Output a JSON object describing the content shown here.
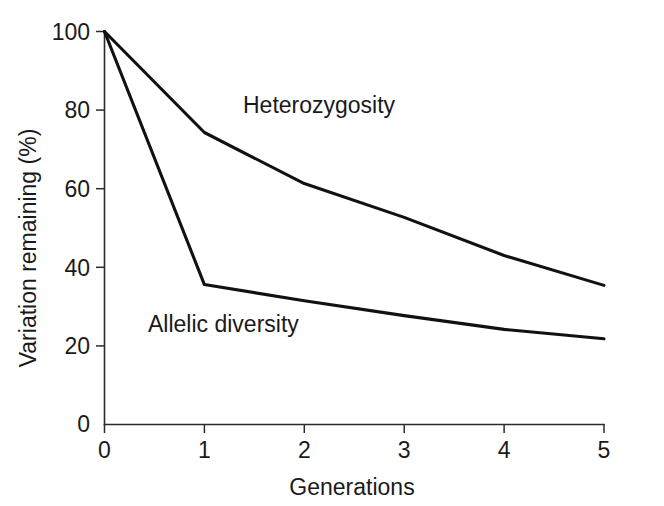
{
  "chart_data": {
    "type": "line",
    "title": "",
    "subtitle": "",
    "xlabel": "Generations",
    "ylabel": "Variation remaining (%)",
    "x": [
      0,
      1,
      2,
      3,
      4,
      5
    ],
    "xlim": [
      0,
      5
    ],
    "ylim": [
      0,
      100
    ],
    "xticks": [
      "0",
      "1",
      "2",
      "3",
      "4",
      "5"
    ],
    "yticks": [
      "0",
      "20",
      "40",
      "60",
      "80",
      "100"
    ],
    "grid": false,
    "legend_position": "inline-annotations",
    "series": [
      {
        "name": "Heterozygosity",
        "label": "Heterozygosity",
        "color": "#111111",
        "values": [
          100,
          74.3,
          61.3,
          52.7,
          43.0,
          35.4
        ]
      },
      {
        "name": "Allelic diversity",
        "label": "Allelic diversity",
        "color": "#111111",
        "values": [
          100,
          35.6,
          31.5,
          27.7,
          24.2,
          21.8
        ]
      }
    ],
    "annotations": [
      {
        "text": "Heterozygosity",
        "x": 1.55,
        "y": 82
      },
      {
        "text": "Allelic diversity",
        "x": 0.48,
        "y": 25
      }
    ]
  },
  "axes": {
    "y_tick_labels": [
      "100",
      "80",
      "60",
      "40",
      "20",
      "0"
    ],
    "x_tick_labels": [
      "0",
      "1",
      "2",
      "3",
      "4",
      "5"
    ],
    "y_axis_title": "Variation remaining (%)",
    "x_axis_title": "Generations"
  },
  "series_labels": {
    "heterozygosity": "Heterozygosity",
    "allelic_diversity": "Allelic diversity"
  },
  "colors": {
    "line": "#111111",
    "axis": "#2b2b2b",
    "text": "#1a1a1a",
    "background": "#ffffff"
  }
}
